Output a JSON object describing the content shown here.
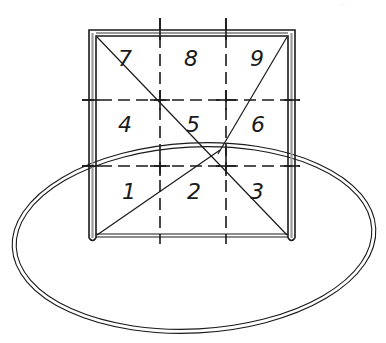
{
  "diagram": {
    "page_mark": "...",
    "zones": [
      {
        "id": 7,
        "label": "7",
        "row": "top",
        "col": "left"
      },
      {
        "id": 8,
        "label": "8",
        "row": "top",
        "col": "center"
      },
      {
        "id": 9,
        "label": "9",
        "row": "top",
        "col": "right"
      },
      {
        "id": 4,
        "label": "4",
        "row": "middle",
        "col": "left"
      },
      {
        "id": 5,
        "label": "5",
        "row": "middle",
        "col": "center"
      },
      {
        "id": 6,
        "label": "6",
        "row": "middle",
        "col": "right"
      },
      {
        "id": 1,
        "label": "1",
        "row": "bottom",
        "col": "left"
      },
      {
        "id": 2,
        "label": "2",
        "row": "bottom",
        "col": "center"
      },
      {
        "id": 3,
        "label": "3",
        "row": "bottom",
        "col": "right"
      }
    ],
    "colors": {
      "line": "#1a1a1a",
      "background": "#ffffff"
    }
  }
}
